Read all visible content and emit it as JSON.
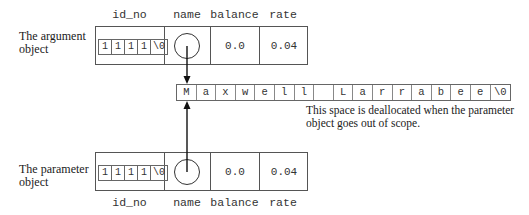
{
  "argument_object": {
    "label_line1": "The argument",
    "label_line2": "object",
    "columns": {
      "id_no": "id_no",
      "name": "name",
      "balance": "balance",
      "rate": "rate"
    },
    "id_no_chars": [
      "1",
      "1",
      "1",
      "1",
      "\\0"
    ],
    "balance": "0.0",
    "rate": "0.04"
  },
  "parameter_object": {
    "label_line1": "The parameter",
    "label_line2": "object",
    "columns": {
      "id_no": "id_no",
      "name": "name",
      "balance": "balance",
      "rate": "rate"
    },
    "id_no_chars": [
      "1",
      "1",
      "1",
      "1",
      "\\0"
    ],
    "balance": "0.0",
    "rate": "0.04"
  },
  "name_string": {
    "chars": [
      "M",
      "a",
      "x",
      "w",
      "e",
      "l",
      "l",
      " ",
      "L",
      "a",
      "r",
      "r",
      "a",
      "b",
      "e",
      "e",
      "\\0"
    ]
  },
  "note": {
    "line1": "This space is deallocated when the parameter",
    "line2": "object goes out of scope."
  }
}
